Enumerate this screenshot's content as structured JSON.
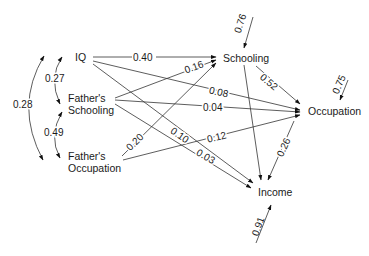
{
  "diagram": {
    "type": "path_diagram",
    "nodes": {
      "iq": "IQ",
      "father_schooling_1": "Father's",
      "father_schooling_2": "Schooling",
      "father_occupation_1": "Father's",
      "father_occupation_2": "Occupation",
      "schooling": "Schooling",
      "occupation": "Occupation",
      "income": "Income"
    },
    "paths": [
      {
        "from": "IQ",
        "to": "Schooling",
        "value": "0.40"
      },
      {
        "from": "Father's Schooling",
        "to": "Schooling",
        "value": "0.16"
      },
      {
        "from": "Father's Occupation",
        "to": "Schooling",
        "value": "0.20"
      },
      {
        "from": "IQ",
        "to": "Occupation",
        "value": "0.08"
      },
      {
        "from": "Father's Schooling",
        "to": "Occupation",
        "value": "0.04"
      },
      {
        "from": "Father's Occupation",
        "to": "Occupation",
        "value": "0.12"
      },
      {
        "from": "Schooling",
        "to": "Occupation",
        "value": "0.52"
      },
      {
        "from": "IQ",
        "to": "Income",
        "value": "0.10"
      },
      {
        "from": "Father's Schooling",
        "to": "Income",
        "value": "0.03"
      },
      {
        "from": "Occupation",
        "to": "Income",
        "value": "0.26"
      },
      {
        "from": "Schooling",
        "to": "Income",
        "value": ""
      },
      {
        "from": "Father's Occupation",
        "to": "Income",
        "value": ""
      }
    ],
    "correlations": [
      {
        "a": "IQ",
        "b": "Father's Schooling",
        "value": "0.27"
      },
      {
        "a": "Father's Schooling",
        "b": "Father's Occupation",
        "value": "0.49"
      },
      {
        "a": "IQ",
        "b": "Father's Occupation",
        "value": "0.28"
      }
    ],
    "residuals": {
      "schooling": "0.76",
      "occupation": "0.75",
      "income": "0.91"
    },
    "labels": {
      "p_iq_sch": "0.40",
      "p_fs_sch": "0.16",
      "p_fo_sch": "0.20",
      "p_iq_occ": "0.08",
      "p_fs_occ": "0.04",
      "p_fo_occ": "0.12",
      "p_sch_occ": "0.52",
      "p_iq_inc": "0.10",
      "p_fs_inc": "0.03",
      "p_occ_inc": "0.26",
      "r_iq_fs": "0.27",
      "r_fs_fo": "0.49",
      "r_iq_fo": "0.28"
    }
  }
}
